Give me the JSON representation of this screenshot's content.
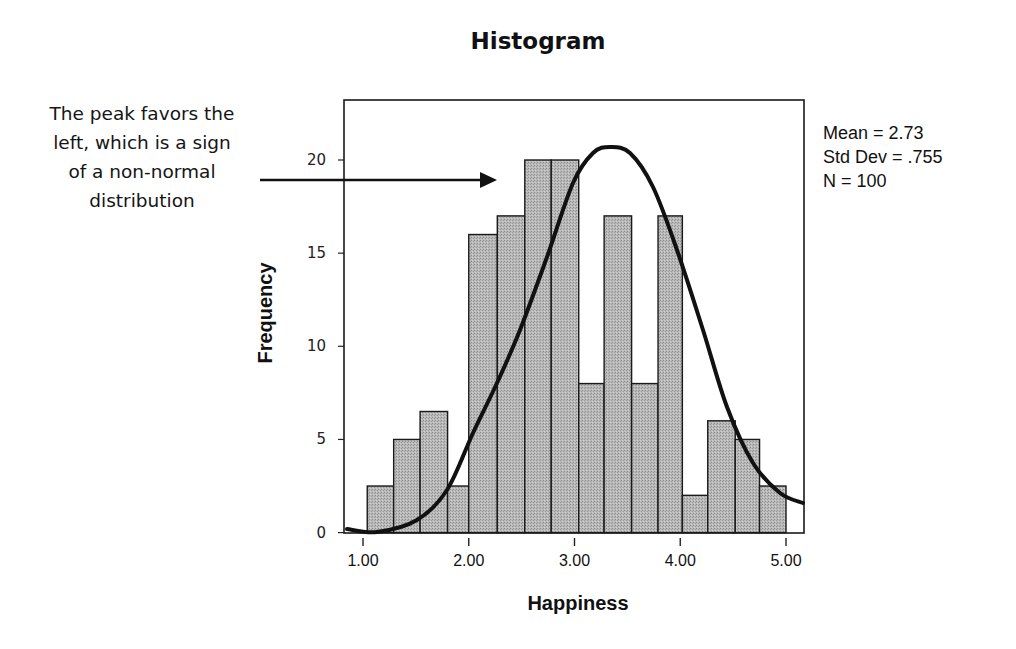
{
  "annotation": {
    "lines": [
      "The peak favors the",
      "left, which is a sign",
      "of a non-normal",
      "distribution"
    ]
  },
  "stats": {
    "mean": "Mean = 2.73",
    "std_dev": "Std Dev = .755",
    "n": "N = 100"
  },
  "chart_data": {
    "type": "bar",
    "title": "Histogram",
    "xlabel": "Happiness",
    "ylabel": "Frequency",
    "x_ticks": [
      "1.00",
      "2.00",
      "3.00",
      "4.00",
      "5.00"
    ],
    "y_ticks": [
      "0",
      "5",
      "10",
      "15",
      "20"
    ],
    "ylim": [
      0,
      23
    ],
    "xlim": [
      0.95,
      5.15
    ],
    "bin_edges": [
      1.04,
      1.29,
      1.54,
      1.8,
      2.0,
      2.27,
      2.53,
      2.78,
      3.04,
      3.28,
      3.54,
      3.79,
      4.02,
      4.26,
      4.52,
      4.75,
      5.0
    ],
    "values": [
      2.5,
      5,
      6.5,
      2.5,
      16,
      17,
      20,
      20,
      8,
      17,
      8,
      17,
      2,
      6,
      5,
      2.5
    ],
    "overlay": {
      "type": "normal-curve",
      "mean": 2.73,
      "std_dev": 0.755,
      "n": 100
    },
    "grid": false,
    "legend": null,
    "colors": {
      "bar_fill": "#b4b4b4",
      "bar_edge": "#1a1a1a",
      "curve": "#111111"
    }
  }
}
